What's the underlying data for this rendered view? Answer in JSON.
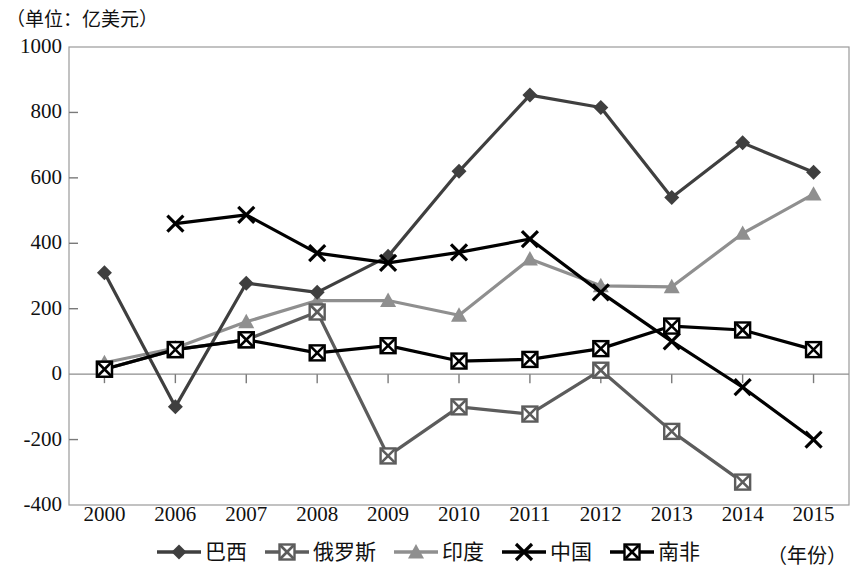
{
  "unit_label": "（单位：亿美元）",
  "year_note": "（年份）",
  "axis": {
    "y_ticks": [
      "1000",
      "800",
      "600",
      "400",
      "200",
      "0",
      "-200",
      "-400"
    ],
    "x_ticks": [
      "2000",
      "2006",
      "2007",
      "2008",
      "2009",
      "2010",
      "2011",
      "2012",
      "2013",
      "2014",
      "2015"
    ]
  },
  "legend": [
    {
      "label": "巴西",
      "marker": "diamond-marker",
      "color": "#3f3f3f"
    },
    {
      "label": "俄罗斯",
      "marker": "square-x-marker",
      "color": "#5c5c5c"
    },
    {
      "label": "印度",
      "marker": "triangle-marker",
      "color": "#8f8f8f"
    },
    {
      "label": "中国",
      "marker": "x-marker",
      "color": "#000000"
    },
    {
      "label": "南非",
      "marker": "square-x-marker",
      "color": "#000000"
    }
  ],
  "chart_data": {
    "type": "line",
    "title": "（单位：亿美元）",
    "xlabel": "（年份）",
    "ylabel": "亿美元",
    "ylim": [
      -400,
      1000
    ],
    "ystep": 200,
    "grid": false,
    "legend_position": "bottom",
    "categories": [
      "2000",
      "2006",
      "2007",
      "2008",
      "2009",
      "2010",
      "2011",
      "2012",
      "2013",
      "2014",
      "2015"
    ],
    "series": [
      {
        "name": "巴西",
        "color": "#3f3f3f",
        "marker": "diamond",
        "values": [
          310,
          -100,
          278,
          250,
          360,
          620,
          853,
          815,
          540,
          707,
          617
        ]
      },
      {
        "name": "俄罗斯",
        "color": "#5c5c5c",
        "marker": "square-x",
        "values": [
          15,
          75,
          105,
          190,
          -250,
          -100,
          -122,
          12,
          -175,
          -330,
          null
        ]
      },
      {
        "name": "印度",
        "color": "#8f8f8f",
        "marker": "triangle",
        "values": [
          35,
          80,
          160,
          225,
          225,
          180,
          352,
          270,
          267,
          430,
          550
        ]
      },
      {
        "name": "中国",
        "color": "#000000",
        "marker": "x",
        "values": [
          null,
          460,
          487,
          370,
          340,
          372,
          413,
          250,
          100,
          -40,
          -200
        ]
      },
      {
        "name": "南非",
        "color": "#000000",
        "marker": "square-x",
        "values": [
          15,
          75,
          105,
          65,
          87,
          40,
          45,
          78,
          147,
          135,
          75
        ]
      }
    ]
  }
}
